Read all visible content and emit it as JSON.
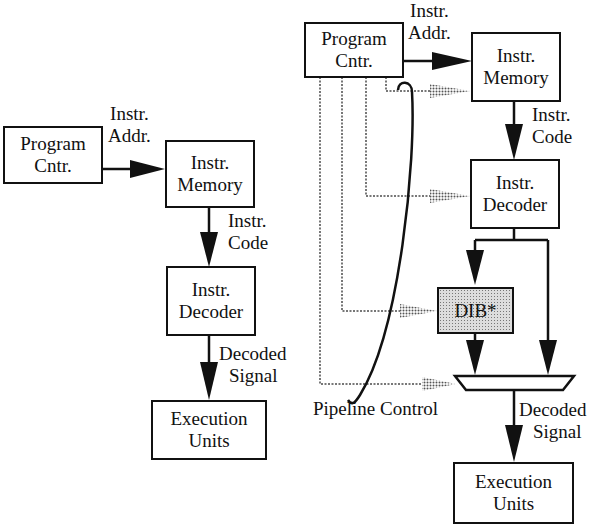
{
  "left_diagram": {
    "program_counter": {
      "line1": "Program",
      "line2": "Cntr."
    },
    "instr_addr_label": {
      "line1": "Instr.",
      "line2": "Addr."
    },
    "instr_memory": {
      "line1": "Instr.",
      "line2": "Memory"
    },
    "instr_code_label": {
      "line1": "Instr.",
      "line2": "Code"
    },
    "instr_decoder": {
      "line1": "Instr.",
      "line2": "Decoder"
    },
    "decoded_signal_label": {
      "line1": "Decoded",
      "line2": "Signal"
    },
    "execution_units": {
      "line1": "Execution",
      "line2": "Units"
    }
  },
  "right_diagram": {
    "program_counter": {
      "line1": "Program",
      "line2": "Cntr."
    },
    "instr_addr_label": {
      "line1": "Instr.",
      "line2": "Addr."
    },
    "instr_memory": {
      "line1": "Instr.",
      "line2": "Memory"
    },
    "instr_code_label": {
      "line1": "Instr.",
      "line2": "Code"
    },
    "instr_decoder": {
      "line1": "Instr.",
      "line2": "Decoder"
    },
    "dib": {
      "label": "DIB*"
    },
    "pipeline_control_label": "Pipeline Control",
    "decoded_signal_label": {
      "line1": "Decoded",
      "line2": "Signal"
    },
    "execution_units": {
      "line1": "Execution",
      "line2": "Units"
    }
  },
  "colors": {
    "line": "#111111",
    "dotted": "#777777",
    "dib_fill": "#dddddd"
  }
}
